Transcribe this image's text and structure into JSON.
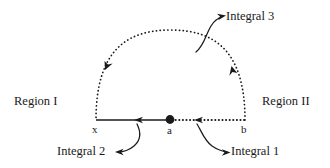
{
  "figure": {
    "labels": {
      "region_1": "Region I",
      "region_2": "Region II",
      "integral_1": "Integral 1",
      "integral_2": "Integral 2",
      "integral_3": "Integral 3",
      "point_x": "x",
      "point_a": "a",
      "point_b": "b"
    },
    "colors": {
      "stroke": "#1a1a1a",
      "background": "#ffffff"
    },
    "geometry": {
      "point_x": [
        96,
        120
      ],
      "point_a": [
        170,
        120
      ],
      "point_b": [
        245,
        120
      ],
      "arc_apex": [
        170,
        48
      ],
      "arc_style": "dotted",
      "segment_x_to_a_style": "solid",
      "segment_a_to_b_style": "dotted",
      "arrow_direction": "counterclockwise (right to left along axis, clockwise-to-left along arc)"
    }
  }
}
